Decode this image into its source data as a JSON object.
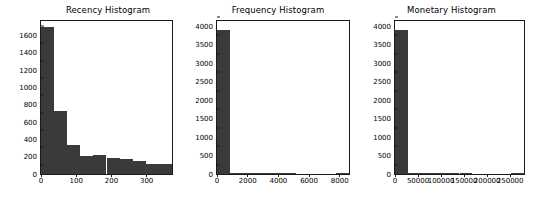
{
  "figure": {
    "background": "#ffffff",
    "bar_color": "#3a3a3a",
    "axis_color": "#1a1a1a"
  },
  "chart_data": [
    {
      "type": "bar",
      "title": "Recency Histogram",
      "xlabel": "",
      "ylabel": "",
      "grid": false,
      "legend": "none",
      "xlim": [
        0,
        372
      ],
      "ylim": [
        0,
        1770
      ],
      "xticks": [
        0,
        100,
        200,
        300
      ],
      "xtick_labels": [
        "0",
        "100",
        "200",
        "300"
      ],
      "yticks": [
        0,
        200,
        400,
        600,
        800,
        1000,
        1200,
        1400,
        1600
      ],
      "ytick_labels": [
        "0",
        "200",
        "400",
        "600",
        "800",
        "1000",
        "1200",
        "1400",
        "1600"
      ],
      "bin_edges": [
        0,
        37,
        74,
        111,
        149,
        186,
        223,
        260,
        298,
        335,
        372
      ],
      "values": [
        1700,
        730,
        330,
        210,
        215,
        180,
        170,
        155,
        120,
        120
      ]
    },
    {
      "type": "bar",
      "title": "Frequency Histogram",
      "xlabel": "",
      "ylabel": "",
      "grid": false,
      "legend": "none",
      "xlim": [
        0,
        8600
      ],
      "ylim": [
        0,
        4150
      ],
      "xticks": [
        0,
        2000,
        4000,
        6000,
        8000
      ],
      "xtick_labels": [
        "0",
        "2000",
        "4000",
        "6000",
        "8000"
      ],
      "yticks": [
        0,
        500,
        1000,
        1500,
        2000,
        2500,
        3000,
        3500,
        4000
      ],
      "ytick_labels": [
        "0",
        "500",
        "1000",
        "1500",
        "2000",
        "2500",
        "3000",
        "3500",
        "4000"
      ],
      "bin_edges": [
        0,
        860,
        1720,
        2580,
        3440,
        4300,
        5160,
        6020,
        6880,
        7740,
        8600
      ],
      "values": [
        3900,
        25,
        4,
        2,
        1,
        1,
        0,
        0,
        0,
        1
      ]
    },
    {
      "type": "bar",
      "title": "Monetary Histogram",
      "xlabel": "",
      "ylabel": "",
      "grid": false,
      "legend": "none",
      "xlim": [
        0,
        280000
      ],
      "ylim": [
        0,
        4150
      ],
      "xticks": [
        0,
        50000,
        100000,
        150000,
        200000,
        250000
      ],
      "xtick_labels": [
        "0",
        "50000",
        "100000",
        "150000",
        "200000",
        "250000"
      ],
      "yticks": [
        0,
        500,
        1000,
        1500,
        2000,
        2500,
        3000,
        3500,
        4000
      ],
      "ytick_labels": [
        "0",
        "500",
        "1000",
        "1500",
        "2000",
        "2500",
        "3000",
        "3500",
        "4000"
      ],
      "bin_edges": [
        0,
        28000,
        56000,
        84000,
        112000,
        140000,
        168000,
        196000,
        224000,
        252000,
        280000
      ],
      "values": [
        3900,
        28,
        6,
        2,
        1,
        1,
        0,
        0,
        0,
        1
      ]
    }
  ]
}
